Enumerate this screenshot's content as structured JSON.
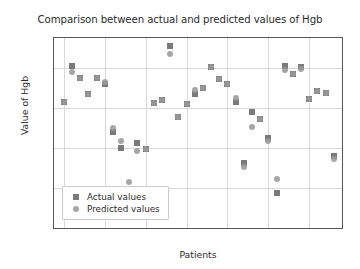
{
  "chart_data": {
    "type": "scatter",
    "title": "Comparison between actual and predicted values of Hgb",
    "xlabel": "Patients",
    "ylabel": "Value of Hgb",
    "xlim": [
      -1.2,
      34
    ],
    "ylim": [
      60,
      155
    ],
    "xticks": [
      0,
      5,
      10,
      15,
      20,
      25,
      30
    ],
    "yticks": [
      60,
      80,
      100,
      120,
      140
    ],
    "grid": true,
    "legend_position": "lower left",
    "x": [
      0,
      1,
      2,
      3,
      4,
      5,
      6,
      7,
      8,
      9,
      10,
      11,
      12,
      13,
      14,
      15,
      16,
      17,
      18,
      19,
      20,
      21,
      22,
      23,
      24,
      25,
      26,
      27,
      28,
      29,
      30,
      31,
      32,
      33
    ],
    "series": [
      {
        "name": "Actual values",
        "marker": "square",
        "color": "#6f6f6f",
        "values": [
          123,
          141,
          135,
          127,
          135,
          132,
          108,
          100,
          78.5,
          102.5,
          99.5,
          122.5,
          124,
          151,
          115.5,
          122,
          127,
          130,
          140.5,
          134.5,
          132,
          123,
          92.5,
          118,
          114.5,
          105,
          77.5,
          141,
          137,
          140.5,
          124.5,
          128.5,
          127.5,
          96
        ]
      },
      {
        "name": "Predicted values",
        "marker": "circle",
        "color": "#9a9a9a",
        "values": [
          123,
          138,
          135,
          127,
          135,
          133,
          110,
          103.5,
          83,
          98.5,
          99.5,
          122.5,
          124,
          147,
          115.5,
          122,
          129,
          130,
          140.5,
          134.5,
          132,
          125,
          90.5,
          110.5,
          114.5,
          103.5,
          84.5,
          139,
          137,
          139.5,
          124.5,
          128.5,
          127.5,
          94.5
        ]
      }
    ]
  },
  "legend": {
    "items": [
      {
        "label": "Actual values",
        "marker": "square"
      },
      {
        "label": "Predicted values",
        "marker": "circle"
      }
    ]
  }
}
